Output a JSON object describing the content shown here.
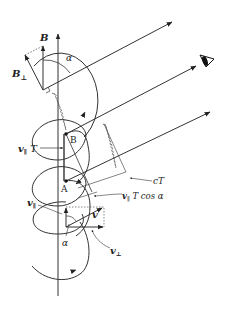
{
  "figure": {
    "labels": {
      "B_top": "B",
      "B_perp": "B",
      "B_perp_sub": "⊥",
      "alpha_top": "α",
      "point_B": "B",
      "point_A": "A",
      "v_par_T": "v",
      "v_par_T_sub": "∥",
      "v_par_T_suffix": " T",
      "cT": "cT",
      "v_par_T_cos_v": "v",
      "v_par_T_cos_sub": "∥",
      "v_par_T_cos_suffix": " T cos α",
      "v_par": "v",
      "v_par_sub": "∥",
      "v": "v",
      "alpha_bottom": "α",
      "v_perp": "v",
      "v_perp_sub": "⊥"
    },
    "icons": {
      "observer": "eye-icon"
    },
    "colors": {
      "line": "#333333",
      "text": "#222222"
    }
  }
}
